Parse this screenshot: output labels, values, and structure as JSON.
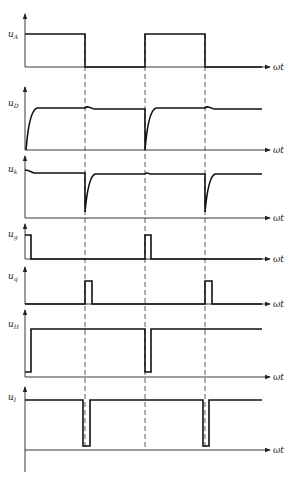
{
  "diagram": {
    "type": "timing-waveform-diagram",
    "x_axis_label": "ωt",
    "dashed_guides_x": [
      85,
      145,
      205
    ],
    "panels": [
      {
        "id": "uA",
        "label_main": "u",
        "label_sub": "A",
        "x_label": "ωt",
        "description": "square wave: high 0–period/2, low second half"
      },
      {
        "id": "uD",
        "label_main": "u",
        "label_sub": "D",
        "x_label": "ωt",
        "description": "exponential rise to steady level, small bump at each falling edge of uA"
      },
      {
        "id": "uk",
        "label_main": "u",
        "label_sub": "k",
        "x_label": "ωt",
        "description": "steady level with sharp negative spike at each falling edge of uA"
      },
      {
        "id": "ug",
        "label_main": "u",
        "label_sub": "g",
        "x_label": "ωt",
        "description": "narrow pulse at each rising edge of uA"
      },
      {
        "id": "uq",
        "label_main": "u",
        "label_sub": "q",
        "x_label": "ωt",
        "description": "narrow pulse at each falling edge of uA"
      },
      {
        "id": "uH",
        "label_main": "u",
        "label_sub": "H",
        "x_label": "ωt",
        "description": "mostly high, brief low notch at each rising edge of uA"
      },
      {
        "id": "uI",
        "label_main": "u",
        "label_sub": "I",
        "x_label": "ωt",
        "description": "mostly high, brief low notch at each falling edge of uA"
      }
    ]
  }
}
